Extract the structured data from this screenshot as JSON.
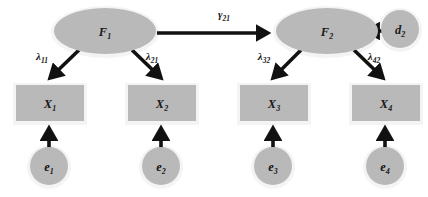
{
  "diagram": {
    "type": "sem-path-diagram",
    "background_color": "#ffffff",
    "shape_fill_color": "#b9b9b9",
    "shape_halo_color": "#f2f2f2",
    "arrow_color": "#111111",
    "text_color": "#1a1a1a"
  },
  "latent_factors": [
    {
      "id": "F1",
      "label_main": "F",
      "label_sub": "1",
      "shape": "ellipse",
      "cx": 105,
      "cy": 31,
      "rx": 51,
      "ry": 23
    },
    {
      "id": "F2",
      "label_main": "F",
      "label_sub": "2",
      "shape": "ellipse",
      "cx": 327,
      "cy": 31,
      "rx": 51,
      "ry": 23
    }
  ],
  "disturbances": [
    {
      "id": "d2",
      "label_main": "d",
      "label_sub": "2",
      "shape": "circle",
      "cx": 400,
      "cy": 29,
      "r": 19
    }
  ],
  "indicators": [
    {
      "id": "X1",
      "label_main": "X",
      "label_sub": "1",
      "shape": "rect",
      "x": 16,
      "y": 85,
      "width": 68,
      "height": 36
    },
    {
      "id": "X2",
      "label_main": "X",
      "label_sub": "2",
      "shape": "rect",
      "x": 128,
      "y": 85,
      "width": 68,
      "height": 36
    },
    {
      "id": "X3",
      "label_main": "X",
      "label_sub": "3",
      "shape": "rect",
      "x": 240,
      "y": 85,
      "width": 68,
      "height": 36
    },
    {
      "id": "X4",
      "label_main": "X",
      "label_sub": "4",
      "shape": "rect",
      "x": 352,
      "y": 85,
      "width": 68,
      "height": 36
    }
  ],
  "errors": [
    {
      "id": "e1",
      "label_main": "e",
      "label_sub": "1",
      "shape": "circle",
      "cx": 49,
      "cy": 166,
      "r": 19
    },
    {
      "id": "e2",
      "label_main": "e",
      "label_sub": "2",
      "shape": "circle",
      "cx": 161,
      "cy": 166,
      "r": 19
    },
    {
      "id": "e3",
      "label_main": "e",
      "label_sub": "3",
      "shape": "circle",
      "cx": 273,
      "cy": 166,
      "r": 19
    },
    {
      "id": "e4",
      "label_main": "e",
      "label_sub": "4",
      "shape": "circle",
      "cx": 385,
      "cy": 166,
      "r": 19
    }
  ],
  "paths": [
    {
      "id": "gamma21",
      "from": "F1",
      "to": "F2",
      "kind": "structural",
      "label_main": "γ",
      "label_sub": "21",
      "label_x": 224,
      "label_y": 18
    },
    {
      "id": "lambda11",
      "from": "F1",
      "to": "X1",
      "kind": "loading",
      "label_main": "λ",
      "label_sub": "11",
      "label_x": 42,
      "label_y": 58
    },
    {
      "id": "lambda21",
      "from": "F1",
      "to": "X2",
      "kind": "loading",
      "label_main": "λ",
      "label_sub": "21",
      "label_x": 152,
      "label_y": 58
    },
    {
      "id": "lambda32",
      "from": "F2",
      "to": "X3",
      "kind": "loading",
      "label_main": "λ",
      "label_sub": "32",
      "label_x": 264,
      "label_y": 58
    },
    {
      "id": "lambda42",
      "from": "F2",
      "to": "X4",
      "kind": "loading",
      "label_main": "λ",
      "label_sub": "42",
      "label_x": 374,
      "label_y": 58
    },
    {
      "id": "d2-to-F2",
      "from": "d2",
      "to": "F2",
      "kind": "disturbance",
      "label_main": "",
      "label_sub": "",
      "label_x": 0,
      "label_y": 0
    },
    {
      "id": "e1-to-X1",
      "from": "e1",
      "to": "X1",
      "kind": "error",
      "label_main": "",
      "label_sub": "",
      "label_x": 0,
      "label_y": 0
    },
    {
      "id": "e2-to-X2",
      "from": "e2",
      "to": "X2",
      "kind": "error",
      "label_main": "",
      "label_sub": "",
      "label_x": 0,
      "label_y": 0
    },
    {
      "id": "e3-to-X3",
      "from": "e3",
      "to": "X3",
      "kind": "error",
      "label_main": "",
      "label_sub": "",
      "label_x": 0,
      "label_y": 0
    },
    {
      "id": "e4-to-X4",
      "from": "e4",
      "to": "X4",
      "kind": "error",
      "label_main": "",
      "label_sub": "",
      "label_x": 0,
      "label_y": 0
    }
  ]
}
